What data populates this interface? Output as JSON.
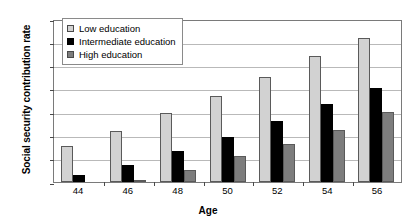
{
  "chart_data": {
    "type": "bar",
    "title": "",
    "xlabel": "Age",
    "ylabel": "Social security contribution rate",
    "categories": [
      "44",
      "46",
      "48",
      "50",
      "52",
      "54",
      "56"
    ],
    "series": [
      {
        "name": "Low education",
        "color": "#d2d2d2",
        "values": [
          15.5,
          22.0,
          29.5,
          37.0,
          45.0,
          54.0,
          62.0
        ]
      },
      {
        "name": "Intermediate education",
        "color": "#000000",
        "values": [
          2.8,
          7.5,
          13.5,
          19.5,
          26.0,
          33.5,
          40.5
        ]
      },
      {
        "name": "High education",
        "color": "#7d7d7d",
        "values": [
          0.0,
          0.7,
          5.3,
          11.0,
          16.5,
          22.5,
          30.0
        ]
      }
    ],
    "ylim": [
      0,
      70
    ],
    "ytick_labels": [
      "0%",
      "10%",
      "20%",
      "30%",
      "40%",
      "50%",
      "60%",
      "70%"
    ],
    "ytick_values": [
      0,
      10,
      20,
      30,
      40,
      50,
      60,
      70
    ],
    "grid": true,
    "legend_position": "upper-left-inside"
  },
  "legend": {
    "items": [
      {
        "label": "Low education"
      },
      {
        "label": "Intermediate education"
      },
      {
        "label": "High education"
      }
    ]
  },
  "axes": {
    "y_title": "Social security contribution rate",
    "x_title": "Age"
  }
}
